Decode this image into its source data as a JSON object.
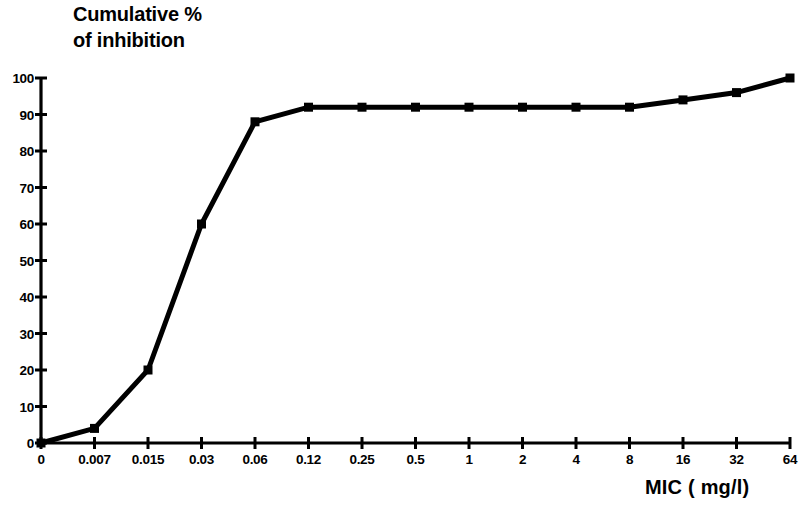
{
  "chart_data": {
    "type": "line",
    "title": "Cumulative %\nof inhibition",
    "xlabel": "MIC ( mg/l)",
    "ylabel": "",
    "categories": [
      "0",
      "0.007",
      "0.015",
      "0.03",
      "0.06",
      "0.12",
      "0.25",
      "0.5",
      "1",
      "2",
      "4",
      "8",
      "16",
      "32",
      "64"
    ],
    "values": [
      0,
      4,
      20,
      60,
      88,
      92,
      92,
      92,
      92,
      92,
      92,
      92,
      94,
      96,
      100
    ],
    "series": [
      {
        "name": "Cumulative % of inhibition",
        "values": [
          0,
          4,
          20,
          60,
          88,
          92,
          92,
          92,
          92,
          92,
          92,
          92,
          94,
          96,
          100
        ]
      }
    ],
    "ylim": [
      0,
      100
    ],
    "ytick_labels": [
      "0",
      "10",
      "20",
      "30",
      "40",
      "50",
      "60",
      "70",
      "80",
      "90",
      "100"
    ],
    "ytick_values": [
      0,
      10,
      20,
      30,
      40,
      50,
      60,
      70,
      80,
      90,
      100
    ],
    "grid": false,
    "legend": "none",
    "marker": "square",
    "line_color": "#000000",
    "marker_color": "#000000",
    "background_color": "#ffffff",
    "axis_color": "#000000"
  },
  "figure": {
    "title_line1": "Cumulative %",
    "title_line2": "of inhibition",
    "x_axis_title": "MIC ( mg/l)"
  }
}
